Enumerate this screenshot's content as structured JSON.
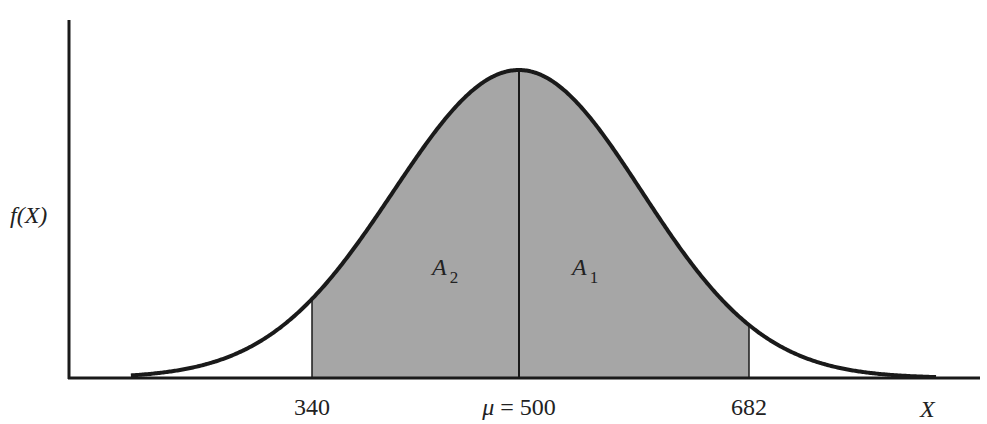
{
  "chart_data": {
    "type": "area",
    "title": "",
    "distribution": "normal",
    "mean": 500,
    "sd": 97,
    "ylabel": "f(X)",
    "xlabel": "X",
    "xlim": [
      200,
      830
    ],
    "grid": false,
    "legend": "none",
    "shaded_region": {
      "from": 340,
      "to": 682
    },
    "divider_at": 500,
    "tick_labels": [
      {
        "value": 340,
        "label": "340"
      },
      {
        "value": 500,
        "label": "μ = 500"
      },
      {
        "value": 682,
        "label": "682"
      }
    ],
    "region_labels": [
      {
        "name": "A",
        "subscript": "2",
        "position": "left-of-mean"
      },
      {
        "name": "A",
        "subscript": "1",
        "position": "right-of-mean"
      }
    ],
    "colors": {
      "curve": "#1a1a1a",
      "shade": "#a6a6a6",
      "axis": "#1a1a1a"
    }
  }
}
